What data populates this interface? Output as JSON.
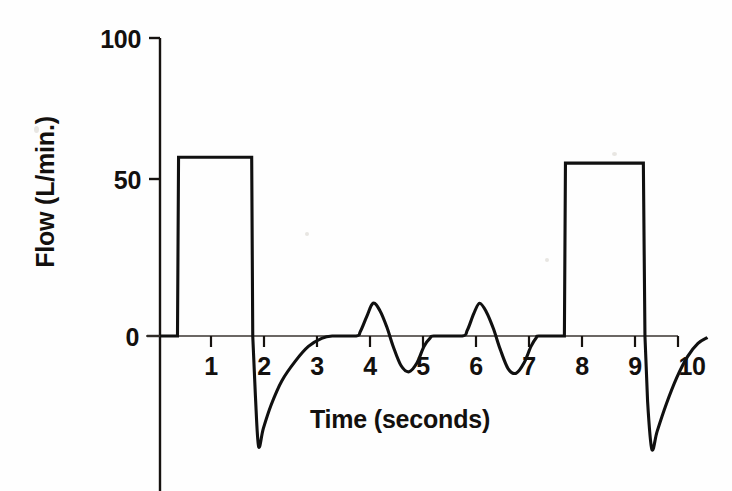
{
  "figure": {
    "name": "flow-time-waveform",
    "background_color": "#fefefe",
    "ink_color": "#101010"
  },
  "chart_data": {
    "type": "line",
    "title": "",
    "xlabel": "Time (seconds)",
    "ylabel": "Flow (L/min.)",
    "xlim": [
      0,
      10.35
    ],
    "ylim": [
      -42,
      100
    ],
    "grid": false,
    "legend": null,
    "x_ticks": [
      1,
      2,
      3,
      4,
      5,
      6,
      7,
      8,
      9,
      10
    ],
    "x_tick_labels": [
      "1",
      "2",
      "3",
      "4",
      "5",
      "6",
      "7",
      "8",
      "9",
      "10"
    ],
    "y_ticks": [
      0,
      50,
      100
    ],
    "y_tick_labels": [
      "0",
      "50",
      "100"
    ],
    "series": [
      {
        "name": "Flow",
        "description": "Two square inspiratory pulses of about 60 L/min, each terminated by a sharp negative expiratory spike that decays back to baseline, separated by two small sinusoidal oscillations of about plus or minus 11 L/min.",
        "points": [
          [
            0.0,
            0
          ],
          [
            0.33,
            0
          ],
          [
            0.35,
            60
          ],
          [
            1.73,
            60
          ],
          [
            1.75,
            0
          ],
          [
            1.8,
            -20
          ],
          [
            1.86,
            -37
          ],
          [
            1.95,
            -31
          ],
          [
            2.1,
            -23
          ],
          [
            2.3,
            -15
          ],
          [
            2.55,
            -8.5
          ],
          [
            2.8,
            -3.5
          ],
          [
            3.05,
            -0.8
          ],
          [
            3.25,
            0
          ],
          [
            3.7,
            0
          ],
          [
            3.78,
            1.5
          ],
          [
            3.9,
            6.5
          ],
          [
            4.02,
            11
          ],
          [
            4.15,
            8.5
          ],
          [
            4.28,
            3.0
          ],
          [
            4.4,
            -3.5
          ],
          [
            4.55,
            -10
          ],
          [
            4.7,
            -12
          ],
          [
            4.85,
            -9
          ],
          [
            4.98,
            -3.5
          ],
          [
            5.1,
            -0.6
          ],
          [
            5.18,
            0
          ],
          [
            5.7,
            0
          ],
          [
            5.8,
            2.0
          ],
          [
            5.92,
            7.5
          ],
          [
            6.03,
            11
          ],
          [
            6.16,
            8.0
          ],
          [
            6.29,
            2.5
          ],
          [
            6.42,
            -4.5
          ],
          [
            6.57,
            -11
          ],
          [
            6.72,
            -12.5
          ],
          [
            6.87,
            -9
          ],
          [
            7.0,
            -3.5
          ],
          [
            7.1,
            -0.6
          ],
          [
            7.16,
            0
          ],
          [
            7.63,
            0
          ],
          [
            7.65,
            58
          ],
          [
            9.12,
            58
          ],
          [
            9.15,
            0
          ],
          [
            9.2,
            -22
          ],
          [
            9.28,
            -38
          ],
          [
            9.38,
            -32
          ],
          [
            9.55,
            -23
          ],
          [
            9.75,
            -14
          ],
          [
            9.95,
            -7
          ],
          [
            10.15,
            -2.5
          ],
          [
            10.33,
            -0.5
          ]
        ],
        "peak_flow": 60,
        "second_peak_flow": 58,
        "min_flow": -38,
        "oscillation_amplitude": 11
      }
    ]
  }
}
